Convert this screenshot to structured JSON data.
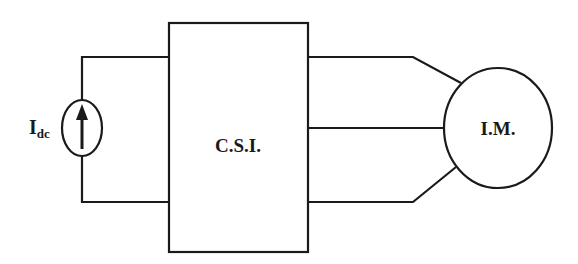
{
  "diagram": {
    "type": "circuit-block-diagram",
    "source": {
      "label_main": "I",
      "label_sub": "dc",
      "symbol": "current-source-arrow-up"
    },
    "inverter": {
      "label": "C.S.I."
    },
    "motor": {
      "label": "I.M."
    },
    "connections": [
      {
        "from": "source",
        "to": "inverter",
        "count": 2
      },
      {
        "from": "inverter",
        "to": "motor",
        "count": 3
      }
    ],
    "colors": {
      "line": "#1a1a1a",
      "background": "#ffffff"
    }
  }
}
